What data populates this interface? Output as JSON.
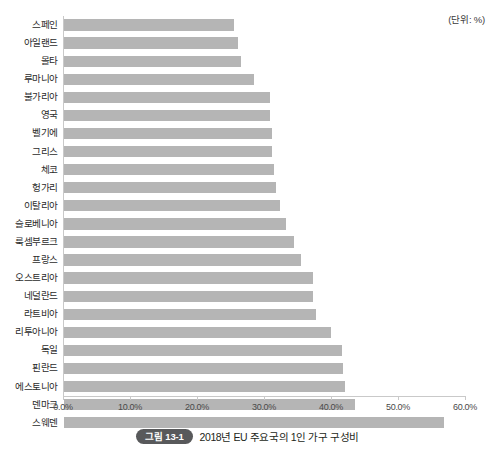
{
  "unit_note": "(단위: %)",
  "caption": {
    "badge": "그림 13-1",
    "text": "2018년 EU 주요국의 1인 가구 구성비"
  },
  "axis": {
    "tick_labels": [
      "0.0%",
      "10.0%",
      "20.0%",
      "30.0%",
      "40.0%",
      "50.0%",
      "60.0%"
    ]
  },
  "colors": {
    "bar": "#b5b5b5",
    "axis_line": "#c9c9c9",
    "badge_background": "#58595b",
    "text": "#231f20"
  },
  "chart_data": {
    "type": "bar",
    "orientation": "horizontal",
    "title": "2018년 EU 주요국의 1인 가구 구성비",
    "xlabel": "",
    "ylabel": "",
    "unit": "%",
    "xlim": [
      0,
      60
    ],
    "xticks": [
      0,
      10,
      20,
      30,
      40,
      50,
      60
    ],
    "grid": false,
    "legend": "none",
    "categories": [
      "스페인",
      "아일랜드",
      "몰타",
      "루마니아",
      "불가리아",
      "영국",
      "벨기에",
      "그리스",
      "체코",
      "헝가리",
      "이탈리아",
      "슬로베니아",
      "룩셈부르크",
      "프랑스",
      "오스트리아",
      "네덜란드",
      "라트비아",
      "리투아니아",
      "독일",
      "핀란드",
      "에스토니아",
      "덴마크",
      "스웨덴"
    ],
    "values": [
      25.4,
      26.0,
      26.4,
      28.4,
      30.7,
      30.8,
      31.0,
      31.1,
      31.4,
      31.6,
      32.3,
      33.2,
      34.4,
      35.4,
      37.1,
      37.2,
      37.6,
      39.8,
      41.5,
      41.7,
      42.0,
      43.4,
      56.7
    ]
  }
}
